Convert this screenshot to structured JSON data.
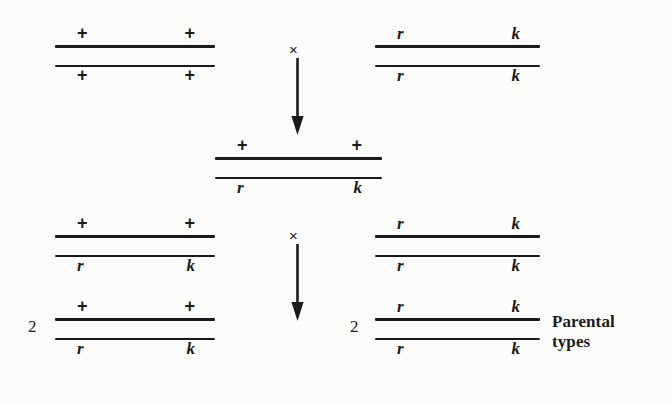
{
  "diagram": {
    "ink_color": "#1a1a1a",
    "background_color": "#fcfcfa",
    "cross_symbol": "×",
    "groups": {
      "parent_left": {
        "name": "parent-left",
        "top_left_allele": "+",
        "top_right_allele": "+",
        "bottom_left_allele": "+",
        "bottom_right_allele": "+",
        "coefficient": ""
      },
      "parent_right": {
        "name": "parent-right",
        "top_left_allele": "r",
        "top_right_allele": "k",
        "bottom_left_allele": "r",
        "bottom_right_allele": "k",
        "coefficient": ""
      },
      "heterozygote": {
        "name": "heterozygote",
        "top_left_allele": "+",
        "top_right_allele": "+",
        "bottom_left_allele": "r",
        "bottom_right_allele": "k",
        "coefficient": ""
      },
      "offspring_left_upper": {
        "name": "offspring-left-upper",
        "top_left_allele": "+",
        "top_right_allele": "+",
        "bottom_left_allele": "r",
        "bottom_right_allele": "k",
        "coefficient": ""
      },
      "offspring_left_lower": {
        "name": "offspring-left-lower",
        "top_left_allele": "+",
        "top_right_allele": "+",
        "bottom_left_allele": "r",
        "bottom_right_allele": "k",
        "coefficient": "2"
      },
      "offspring_right_upper": {
        "name": "offspring-right-upper",
        "top_left_allele": "r",
        "top_right_allele": "k",
        "bottom_left_allele": "r",
        "bottom_right_allele": "k",
        "coefficient": ""
      },
      "offspring_right_lower": {
        "name": "offspring-right-lower",
        "top_left_allele": "r",
        "top_right_allele": "k",
        "bottom_left_allele": "r",
        "bottom_right_allele": "k",
        "coefficient": "2"
      }
    },
    "annotation": {
      "line1": "Parental",
      "line2": "types"
    }
  }
}
